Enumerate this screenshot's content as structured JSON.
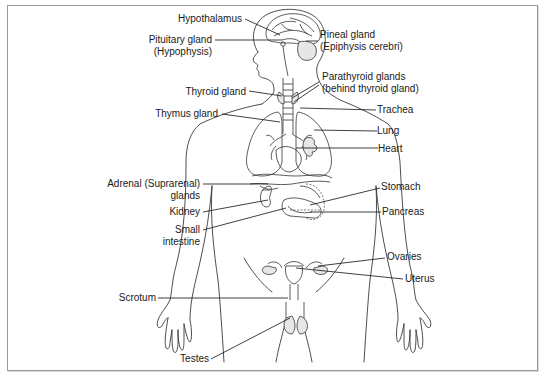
{
  "diagram": {
    "colors": {
      "line": "#333333",
      "frame": "#9a9a9a",
      "text": "#1a1a1a",
      "background": "#ffffff"
    },
    "labels": {
      "hypothalamus": "Hypothalamus",
      "pituitary_line1": "Pituitary gland",
      "pituitary_line2": "(Hypophysis)",
      "pineal_line1": "Pineal gland",
      "pineal_line2": "(Epiphysis cerebri)",
      "parathyroid_line1": "Parathyroid glands",
      "parathyroid_line2": "(behind thyroid gland)",
      "thyroid": "Thyroid gland",
      "thymus": "Thymus gland",
      "trachea": "Trachea",
      "lung": "Lung",
      "heart": "Heart",
      "adrenal_line1": "Adrenal (Suprarenal)",
      "adrenal_line2": "glands",
      "kidney": "Kidney",
      "small_intestine_line1": "Small",
      "small_intestine_line2": "intestine",
      "stomach": "Stomach",
      "pancreas": "Pancreas",
      "ovaries": "Ovaries",
      "uterus": "Uterus",
      "scrotum": "Scrotum",
      "testes": "Testes"
    }
  }
}
